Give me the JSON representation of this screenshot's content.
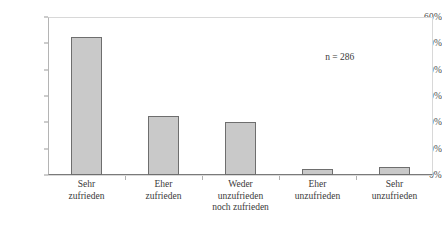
{
  "chart_data": {
    "type": "bar",
    "title": "",
    "subtitle": "",
    "xlabel": "",
    "ylabel": "",
    "categories": [
      "Sehr zufrieden",
      "Eher zufrieden",
      "Weder unzufrieden noch zufrieden",
      "Eher unzufrieden",
      "Sehr unzufrieden"
    ],
    "category_lines": [
      [
        "Sehr",
        "zufrieden"
      ],
      [
        "Eher",
        "zufrieden"
      ],
      [
        "Weder",
        "unzufrieden",
        "noch zufrieden"
      ],
      [
        "Eher",
        "unzufrieden"
      ],
      [
        "Sehr",
        "unzufrieden"
      ]
    ],
    "values": [
      52.5,
      22.5,
      20.0,
      2.3,
      3.0
    ],
    "value_unit": "%",
    "ylim": [
      0,
      60
    ],
    "ytick_values": [
      0,
      10,
      20,
      30,
      40,
      50,
      60
    ],
    "ytick_labels": [
      "0%",
      "10%",
      "20%",
      "30%",
      "40%",
      "50%",
      "60%"
    ],
    "grid": true,
    "legend": false,
    "legend_position": "none",
    "annotations": [
      {
        "text": "n = 286",
        "x_frac": 0.72,
        "y_value": 44.5
      }
    ],
    "bar_fill_color": "#c9c9c9",
    "bar_border_color": "#6e6e6e",
    "gridline_color": "#d9d9d9",
    "axis_color": "#7a7a7a",
    "background_color": "#ffffff",
    "text_color": "#3a3a3a"
  }
}
